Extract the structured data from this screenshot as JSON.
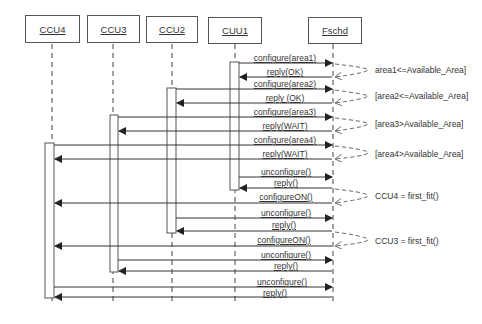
{
  "participants": [
    {
      "id": "ccu4",
      "label": "CCU4",
      "x": 25,
      "w": 55,
      "line_x": 52
    },
    {
      "id": "ccu3",
      "label": "CCU3",
      "x": 87,
      "w": 53,
      "line_x": 113
    },
    {
      "id": "ccu2",
      "label": "CCU2",
      "x": 146,
      "w": 52,
      "line_x": 172
    },
    {
      "id": "cuu1",
      "label": "CUU1",
      "x": 208,
      "w": 54,
      "line_x": 235
    },
    {
      "id": "fschd",
      "label": "Fschd",
      "x": 308,
      "w": 54,
      "line_x": 333
    }
  ],
  "messages": [
    {
      "label": "configure(area1)",
      "y": 63
    },
    {
      "label": "reply(OK)",
      "y": 77
    },
    {
      "label": "configure(area2)",
      "y": 89
    },
    {
      "label": "reply (OK)",
      "y": 103
    },
    {
      "label": "configure(area3)",
      "y": 117
    },
    {
      "label": "reply(WAIT)",
      "y": 131
    },
    {
      "label": "configure(area4)",
      "y": 145
    },
    {
      "label": "reply(WAIT)",
      "y": 159
    },
    {
      "label": "unconfigure()",
      "y": 177
    },
    {
      "label": "reply()",
      "y": 188
    },
    {
      "label": "configureON()",
      "y": 201
    },
    {
      "label": "unconfigure()",
      "y": 218
    },
    {
      "label": "reply()",
      "y": 230
    },
    {
      "label": "configureON()",
      "y": 244
    },
    {
      "label": "unconfigure()",
      "y": 258
    },
    {
      "label": "reply()",
      "y": 270
    },
    {
      "label": "unconfigure()",
      "y": 286
    },
    {
      "label": "reply()",
      "y": 297
    }
  ],
  "conditions": [
    {
      "text": "area1<=Available_Area]",
      "y": 70
    },
    {
      "text": "[area2<=Available_Area]",
      "y": 96
    },
    {
      "text": "[area3>Available_Area]",
      "y": 124
    },
    {
      "text": "[area4>Available_Area]",
      "y": 155
    },
    {
      "text": "CCU4 = first_fit()",
      "y": 196
    },
    {
      "text": "CCU3 = first_fit()",
      "y": 241
    }
  ]
}
